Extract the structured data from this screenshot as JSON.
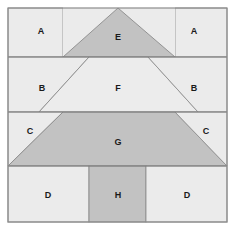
{
  "figure": {
    "background_color": "#ffffff",
    "border_color": "#8c8c8c",
    "divider_color": "#7a7a7a",
    "outline_color": "#8a8a8a",
    "fill_light": "#ebebeb",
    "fill_medium": "#c2c2c2",
    "frame": {
      "x": 8,
      "y": 8,
      "width": 219,
      "height": 214
    },
    "band_dividers_y": [
      57,
      112,
      166
    ],
    "labels": {
      "a_left": "A",
      "a_right": "A",
      "b_left": "B",
      "b_right": "B",
      "c_left": "C",
      "c_right": "C",
      "d_left": "D",
      "d_right": "D",
      "e": "E",
      "f": "F",
      "g": "G",
      "h": "H"
    },
    "regions": [
      {
        "id": "a-left",
        "label": "A",
        "shade": "light",
        "band": 1,
        "label_x": 41,
        "label_y": 31
      },
      {
        "id": "e-triangle",
        "label": "E",
        "shade": "medium",
        "band": 1,
        "label_x": 118,
        "label_y": 37
      },
      {
        "id": "a-right",
        "label": "A",
        "shade": "light",
        "band": 1,
        "label_x": 194,
        "label_y": 31
      },
      {
        "id": "b-left",
        "label": "B",
        "shade": "light",
        "band": 2,
        "label_x": 42,
        "label_y": 88
      },
      {
        "id": "f-trapezoid",
        "label": "F",
        "shade": "light",
        "band": 2,
        "label_x": 118,
        "label_y": 88
      },
      {
        "id": "b-right",
        "label": "B",
        "shade": "light",
        "band": 2,
        "label_x": 194,
        "label_y": 88
      },
      {
        "id": "c-left",
        "label": "C",
        "shade": "light",
        "band": 3,
        "label_x": 30,
        "label_y": 131
      },
      {
        "id": "g-trapezoid",
        "label": "G",
        "shade": "medium",
        "band": 3,
        "label_x": 118,
        "label_y": 142
      },
      {
        "id": "c-right",
        "label": "C",
        "shade": "light",
        "band": 3,
        "label_x": 206,
        "label_y": 131
      },
      {
        "id": "d-left",
        "label": "D",
        "shade": "light",
        "band": 4,
        "label_x": 48,
        "label_y": 195
      },
      {
        "id": "h-square",
        "label": "H",
        "shade": "medium",
        "band": 4,
        "label_x": 118,
        "label_y": 195
      },
      {
        "id": "d-right",
        "label": "D",
        "shade": "light",
        "band": 4,
        "label_x": 187,
        "label_y": 195
      }
    ]
  }
}
